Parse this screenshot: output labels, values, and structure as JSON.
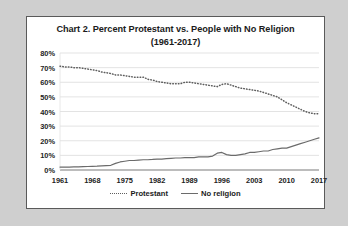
{
  "chart_data": {
    "type": "line",
    "title": "Chart 2. Percent Protestant vs. People with No Religion",
    "subtitle": "(1961-2017)",
    "xlabel": "",
    "ylabel": "",
    "xlim": [
      1961,
      2017
    ],
    "ylim": [
      0,
      80
    ],
    "grid": true,
    "legend_position": "bottom",
    "y_ticks": [
      "0%",
      "10%",
      "20%",
      "30%",
      "40%",
      "50%",
      "60%",
      "70%",
      "80%"
    ],
    "y_tick_values": [
      0,
      10,
      20,
      30,
      40,
      50,
      60,
      70,
      80
    ],
    "x_ticks": [
      "1961",
      "1968",
      "1975",
      "1982",
      "1989",
      "1996",
      "2003",
      "2010",
      "2017"
    ],
    "x_tick_values": [
      1961,
      1968,
      1975,
      1982,
      1989,
      1996,
      2003,
      2010,
      2017
    ],
    "x": [
      1961,
      1962,
      1963,
      1964,
      1965,
      1966,
      1967,
      1968,
      1969,
      1970,
      1971,
      1972,
      1973,
      1974,
      1975,
      1976,
      1977,
      1978,
      1979,
      1980,
      1981,
      1982,
      1983,
      1984,
      1985,
      1986,
      1987,
      1988,
      1989,
      1990,
      1991,
      1992,
      1993,
      1994,
      1995,
      1996,
      1997,
      1998,
      1999,
      2000,
      2001,
      2002,
      2003,
      2004,
      2005,
      2006,
      2007,
      2008,
      2009,
      2010,
      2011,
      2012,
      2013,
      2014,
      2015,
      2016,
      2017
    ],
    "series": [
      {
        "name": "Protestant",
        "style": "dotted",
        "color": "#5e5e5e",
        "values": [
          71,
          70.5,
          70.5,
          70,
          70,
          69.5,
          69,
          68.5,
          68,
          67,
          66.5,
          66,
          65,
          65,
          64.5,
          64,
          63.5,
          63.5,
          63.5,
          62,
          61.5,
          60.5,
          60,
          59.5,
          59,
          59,
          59,
          60,
          60,
          59.5,
          59,
          58.5,
          58,
          57.5,
          57,
          58.5,
          59,
          58,
          57,
          56,
          55.5,
          55,
          54.5,
          54,
          53,
          52,
          51,
          50,
          48,
          46,
          44.5,
          43,
          41.5,
          40,
          39,
          38.5,
          38.5
        ]
      },
      {
        "name": "No religion",
        "style": "solid",
        "color": "#6b6b6b",
        "values": [
          2,
          2,
          2,
          2.1,
          2.2,
          2.3,
          2.4,
          2.5,
          2.6,
          2.8,
          3,
          3.2,
          4.5,
          5.5,
          6,
          6.5,
          6.5,
          6.8,
          7,
          7,
          7.2,
          7.5,
          7.5,
          7.8,
          8,
          8.2,
          8.2,
          8.5,
          8.5,
          8.5,
          9,
          9,
          9,
          9.5,
          11.5,
          12,
          10.5,
          10,
          10,
          10.5,
          11,
          12,
          12,
          12.5,
          13,
          13,
          14,
          14.5,
          15,
          15,
          16,
          17,
          18,
          19,
          20,
          21,
          22
        ]
      }
    ]
  }
}
